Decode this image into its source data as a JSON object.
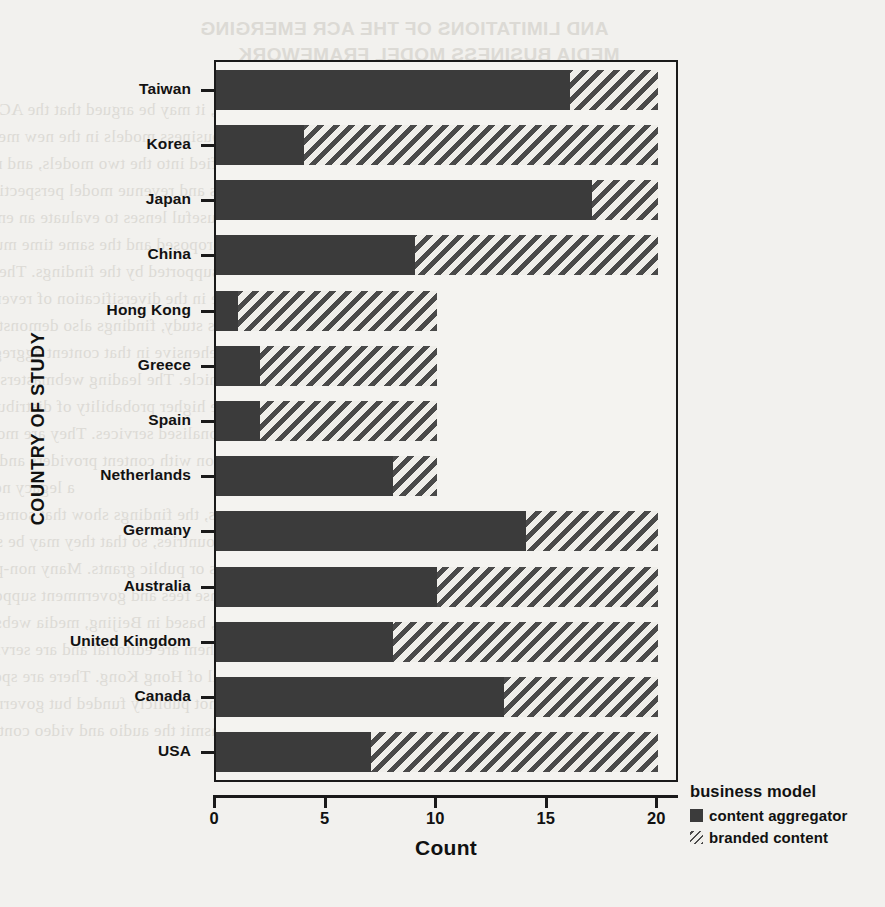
{
  "chart_data": {
    "type": "bar",
    "orientation": "horizontal",
    "stacked": true,
    "title": "",
    "xlabel": "Count",
    "ylabel": "COUNTRY OF STUDY",
    "xlim": [
      0,
      20.8
    ],
    "xticks": [
      0,
      5,
      10,
      15,
      20
    ],
    "xtick_labels": [
      "0",
      "5",
      "10",
      "15",
      "20"
    ],
    "grid": false,
    "legend_position": "right",
    "legend_title": "business model",
    "categories": [
      "Taiwan",
      "Korea",
      "Japan",
      "China",
      "Hong Kong",
      "Greece",
      "Spain",
      "Netherlands",
      "Germany",
      "Australia",
      "United Kingdom",
      "Canada",
      "USA"
    ],
    "series": [
      {
        "name": "content aggregator",
        "color": "#3b3b3b",
        "pattern": "solid",
        "values": [
          16,
          4,
          17,
          9,
          1,
          2,
          2,
          8,
          14,
          10,
          8,
          13,
          7
        ]
      },
      {
        "name": "branded content",
        "color": "#4a4a4a",
        "pattern": "diagonal-hatch",
        "values": [
          4,
          16,
          3,
          11,
          9,
          8,
          8,
          2,
          6,
          10,
          12,
          7,
          13
        ]
      }
    ],
    "totals": [
      20,
      20,
      20,
      20,
      10,
      10,
      10,
      10,
      20,
      20,
      20,
      20,
      20
    ]
  },
  "axes": {
    "x_title": "Count",
    "y_title": "COUNTRY OF STUDY"
  },
  "legend": {
    "title": "business model",
    "items": [
      {
        "label": "content aggregator",
        "swatch": "solid-square-icon"
      },
      {
        "label": "branded content",
        "swatch": "hatched-square-icon"
      }
    ]
  },
  "background_bleed": {
    "heading_line1": "AND LIMITATIONS OF THE ACR EMERGING",
    "heading_line2": "MEDIA BUSINESS MODEL FRAMEWORK",
    "lines": [
      "the findings, it may be argued that the ACR emerging media business model framework",
      "emerging business models in the new media industry. Most of the websites studied in",
      "be classified into the two models, and many of them could be categorized",
      "the business and revenue model perspectives. This supports the notion that",
      "and ACR are useful lenses to evaluate an emerging business model and that",
      "the proposed and the same time much of the framework's content aggregator model",
      "also supported by the findings. The websites of newspapers and broadcasters",
      "evidence in the diversification of revenue sources in the new media environment.",
      "In this study, findings also demonstrate that the ACR emerging media framework",
      "comprehensive in that content aggregators, some of which are providing services",
      "a new vehicle. The leading webmasters of the studied websites seek ways to take",
      "most of the higher probability of distribution and consumption, leading to higher",
      "more personalised services. They are more likely to converge their content into",
      "cooperation with content providers and to look for ways to improve the diversity",
      "a legacy news organization",
      "Besides, the findings show that some of the non-profit websites are situated at some",
      "countries, so that they may be supported by private organizations, public",
      "donations or public grants. Many non-profit media outlets in Europe are funded both",
      "by license fees and government support. Also, in some countries, such as in Hong",
      "Kong, based in Beijing, media websites are funded by the government. Two of",
      "them are editorial and are serving purposes of the industry and the Press",
      "Council of Hong Kong. There are special types of China-and-media because they",
      "are not publicly funded but governmental units that utilize webcasts to the",
      "retransmit the audio and video content. Also, some webcasters, such as NHK and"
    ]
  }
}
